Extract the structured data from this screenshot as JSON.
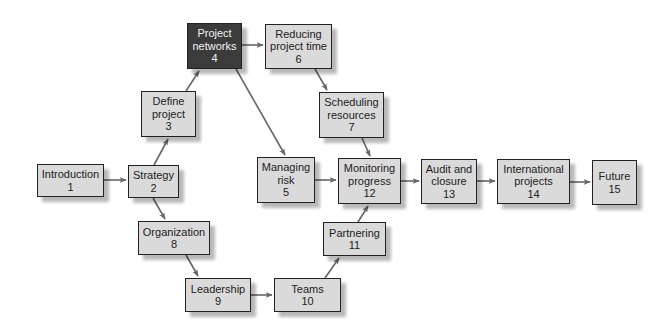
{
  "diagram": {
    "type": "flowchart",
    "colors": {
      "node_fill": "#dadada",
      "node_fill_highlight": "#3b3b3b",
      "node_border": "#222222",
      "node_text": "#222222",
      "node_text_highlight": "#f2f2f2",
      "edge": "#666666"
    },
    "nodes": [
      {
        "id": "1",
        "label": "Introduction",
        "number": "1",
        "x": 37,
        "y": 164,
        "w": 67,
        "h": 33,
        "highlight": false
      },
      {
        "id": "2",
        "label": "Strategy",
        "number": "2",
        "x": 128,
        "y": 165,
        "w": 51,
        "h": 33,
        "highlight": false
      },
      {
        "id": "3",
        "label": "Define\nproject",
        "number": "3",
        "x": 141,
        "y": 91,
        "w": 55,
        "h": 46,
        "highlight": false
      },
      {
        "id": "4",
        "label": "Project\nnetworks",
        "number": "4",
        "x": 187,
        "y": 23,
        "w": 55,
        "h": 46,
        "highlight": true
      },
      {
        "id": "6",
        "label": "Reducing\nproject time",
        "number": "6",
        "x": 265,
        "y": 24,
        "w": 67,
        "h": 45,
        "highlight": false
      },
      {
        "id": "7",
        "label": "Scheduling\nresources",
        "number": "7",
        "x": 319,
        "y": 92,
        "w": 65,
        "h": 46,
        "highlight": false
      },
      {
        "id": "5",
        "label": "Managing\nrisk",
        "number": "5",
        "x": 257,
        "y": 157,
        "w": 58,
        "h": 46,
        "highlight": false
      },
      {
        "id": "12",
        "label": "Monitoring\nprogress",
        "number": "12",
        "x": 338,
        "y": 158,
        "w": 63,
        "h": 46,
        "highlight": false
      },
      {
        "id": "13",
        "label": "Audit and\nclosure",
        "number": "13",
        "x": 421,
        "y": 159,
        "w": 56,
        "h": 45,
        "highlight": false
      },
      {
        "id": "14",
        "label": "International\nprojects",
        "number": "14",
        "x": 497,
        "y": 159,
        "w": 73,
        "h": 45,
        "highlight": false
      },
      {
        "id": "15",
        "label": "Future",
        "number": "15",
        "x": 592,
        "y": 160,
        "w": 45,
        "h": 45,
        "highlight": false
      },
      {
        "id": "8",
        "label": "Organization",
        "number": "8",
        "x": 138,
        "y": 221,
        "w": 72,
        "h": 34,
        "highlight": false
      },
      {
        "id": "9",
        "label": "Leadership",
        "number": "9",
        "x": 185,
        "y": 278,
        "w": 66,
        "h": 34,
        "highlight": false
      },
      {
        "id": "10",
        "label": "Teams",
        "number": "10",
        "x": 274,
        "y": 278,
        "w": 67,
        "h": 34,
        "highlight": false
      },
      {
        "id": "11",
        "label": "Partnering",
        "number": "11",
        "x": 323,
        "y": 222,
        "w": 63,
        "h": 34,
        "highlight": false
      }
    ],
    "edges": [
      {
        "from": "1",
        "to": "2",
        "x1": 104,
        "y1": 180,
        "x2": 126,
        "y2": 180
      },
      {
        "from": "2",
        "to": "3",
        "x1": 154,
        "y1": 165,
        "x2": 168,
        "y2": 139
      },
      {
        "from": "3",
        "to": "4",
        "x1": 186,
        "y1": 91,
        "x2": 199,
        "y2": 71
      },
      {
        "from": "4",
        "to": "6",
        "x1": 242,
        "y1": 45,
        "x2": 263,
        "y2": 45
      },
      {
        "from": "4",
        "to": "5",
        "x1": 236,
        "y1": 69,
        "x2": 285,
        "y2": 155
      },
      {
        "from": "6",
        "to": "7",
        "x1": 315,
        "y1": 69,
        "x2": 327,
        "y2": 90
      },
      {
        "from": "7",
        "to": "12",
        "x1": 362,
        "y1": 138,
        "x2": 370,
        "y2": 156
      },
      {
        "from": "5",
        "to": "12",
        "x1": 315,
        "y1": 180,
        "x2": 336,
        "y2": 180
      },
      {
        "from": "12",
        "to": "13",
        "x1": 401,
        "y1": 181,
        "x2": 419,
        "y2": 181
      },
      {
        "from": "13",
        "to": "14",
        "x1": 477,
        "y1": 181,
        "x2": 495,
        "y2": 181
      },
      {
        "from": "14",
        "to": "15",
        "x1": 570,
        "y1": 182,
        "x2": 590,
        "y2": 182
      },
      {
        "from": "2",
        "to": "8",
        "x1": 153,
        "y1": 198,
        "x2": 165,
        "y2": 219
      },
      {
        "from": "8",
        "to": "9",
        "x1": 186,
        "y1": 255,
        "x2": 198,
        "y2": 276
      },
      {
        "from": "9",
        "to": "10",
        "x1": 251,
        "y1": 295,
        "x2": 272,
        "y2": 295
      },
      {
        "from": "10",
        "to": "11",
        "x1": 325,
        "y1": 278,
        "x2": 339,
        "y2": 258
      },
      {
        "from": "11",
        "to": "12",
        "x1": 358,
        "y1": 222,
        "x2": 368,
        "y2": 206
      }
    ]
  }
}
